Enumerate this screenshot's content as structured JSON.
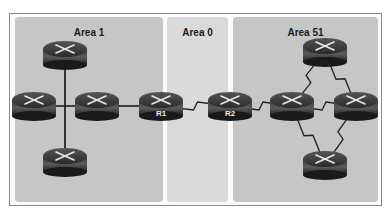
{
  "diagram": {
    "type": "OSPF multi-area topology",
    "areas": [
      {
        "id": "area1",
        "label": "Area 1",
        "x": 15,
        "width": 148,
        "color": "#c4c4c4"
      },
      {
        "id": "area0",
        "label": "Area 0",
        "x": 167,
        "width": 61,
        "color": "#d9d9d9"
      },
      {
        "id": "area51",
        "label": "Area 51",
        "x": 233,
        "width": 145,
        "color": "#c4c4c4"
      }
    ],
    "routers": [
      {
        "id": "a1-top",
        "label": "",
        "x": 65,
        "y": 55
      },
      {
        "id": "a1-left",
        "label": "",
        "x": 34,
        "y": 106
      },
      {
        "id": "a1-mid",
        "label": "",
        "x": 97,
        "y": 106
      },
      {
        "id": "a1-bottom",
        "label": "",
        "x": 65,
        "y": 162
      },
      {
        "id": "r1",
        "label": "R1",
        "x": 161,
        "y": 106
      },
      {
        "id": "r2",
        "label": "R2",
        "x": 230,
        "y": 106
      },
      {
        "id": "a51-left",
        "label": "",
        "x": 292,
        "y": 106
      },
      {
        "id": "a51-right",
        "label": "",
        "x": 356,
        "y": 106
      },
      {
        "id": "a51-top",
        "label": "",
        "x": 325,
        "y": 52
      },
      {
        "id": "a51-bottom",
        "label": "",
        "x": 325,
        "y": 165
      }
    ],
    "links": [
      {
        "from": "a1-top",
        "to": "a1-bottom",
        "kind": "ethernet"
      },
      {
        "from": "a1-left",
        "to": "a1-mid",
        "kind": "ethernet"
      },
      {
        "from": "a1-mid",
        "to": "r1",
        "kind": "ethernet"
      },
      {
        "from": "r1",
        "to": "r2",
        "kind": "serial"
      },
      {
        "from": "r2",
        "to": "a51-left",
        "kind": "serial"
      },
      {
        "from": "a51-left",
        "to": "a51-right",
        "kind": "serial"
      },
      {
        "from": "a51-left",
        "to": "a51-top",
        "kind": "serial"
      },
      {
        "from": "a51-top",
        "to": "a51-right",
        "kind": "serial"
      },
      {
        "from": "a51-left",
        "to": "a51-bottom",
        "kind": "serial"
      },
      {
        "from": "a51-bottom",
        "to": "a51-right",
        "kind": "serial"
      }
    ]
  }
}
